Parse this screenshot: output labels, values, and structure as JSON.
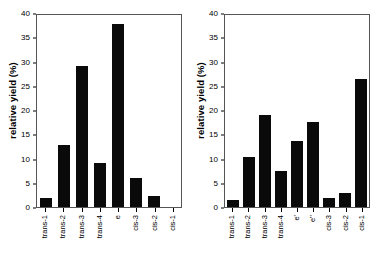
{
  "chart_data": [
    {
      "type": "bar",
      "title": "",
      "xlabel": "",
      "ylabel": "relative yield (%)",
      "ylim": [
        0,
        40
      ],
      "yticks": [
        0,
        5,
        10,
        15,
        20,
        25,
        30,
        35,
        40
      ],
      "ytick_labels": [
        "0",
        "5",
        "10",
        "15",
        "20",
        "25",
        "30",
        "35",
        "40"
      ],
      "grid": false,
      "legend": "none",
      "bar_color": "#0a0a0a",
      "categories": [
        "trans-1",
        "trans-2",
        "trans-3",
        "trans-4",
        "e",
        "cis-3",
        "cis-2",
        "cis-1"
      ],
      "values": [
        1.9,
        13.0,
        29.4,
        9.1,
        38.1,
        6.1,
        2.2,
        0
      ]
    },
    {
      "type": "bar",
      "title": "",
      "xlabel": "",
      "ylabel": "relative yield (%)",
      "ylim": [
        0,
        40
      ],
      "yticks": [
        0,
        5,
        10,
        15,
        20,
        25,
        30,
        35,
        40
      ],
      "ytick_labels": [
        "0",
        "5",
        "10",
        "15",
        "20",
        "25",
        "30",
        "35",
        "40"
      ],
      "grid": false,
      "legend": "none",
      "bar_color": "#0a0a0a",
      "categories": [
        "trans-1",
        "trans-2",
        "trans-3",
        "trans-4",
        "e'",
        "e''",
        "cis-3",
        "cis-2",
        "cis-1"
      ],
      "values": [
        1.4,
        10.4,
        19.2,
        7.4,
        13.7,
        17.7,
        1.8,
        3.0,
        26.6
      ]
    }
  ]
}
